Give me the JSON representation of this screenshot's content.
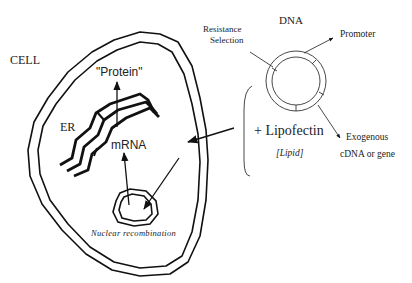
{
  "diagram": {
    "colors": {
      "stroke": "#111111",
      "text": "#222222",
      "background": "#ffffff"
    },
    "cell": {
      "label": "CELL",
      "organelles": {
        "er_label": "ER",
        "protein_label": "\"Protein\"",
        "mrna_label": "mRNA",
        "nucleus_label": "Nuclear recombination"
      }
    },
    "dna": {
      "label": "DNA",
      "regions": {
        "resistance_line1": "Resistance",
        "resistance_line2": "Selection",
        "promoter": "Promoter",
        "exogenous_line1": "Exogenous",
        "exogenous_line2": "cDNA or gene"
      }
    },
    "reagent": {
      "label": "+ Lipofectin",
      "sublabel": "[Lipid]"
    },
    "flow": [
      {
        "from": "Lipofectin + DNA",
        "to": "cell interior"
      },
      {
        "from": "cell interior",
        "to": "nucleus"
      },
      {
        "from": "nucleus",
        "to": "mRNA"
      },
      {
        "from": "mRNA",
        "to": "Protein"
      }
    ]
  }
}
